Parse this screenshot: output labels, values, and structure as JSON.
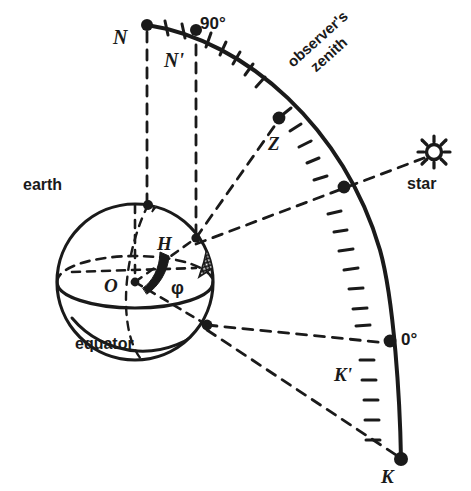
{
  "figure": {
    "ink_color": "#1a1a1a",
    "background": "#ffffff"
  },
  "labels": {
    "north_pole_celestial": "N",
    "north_pole_earth": "N'",
    "degrees_90": "90°",
    "degrees_0": "0°",
    "zenith_point": "Z",
    "observers_zenith": "observer's\nzenith",
    "observers_zenith_line1": "observer's",
    "observers_zenith_line2": "zenith",
    "star": "star",
    "earth": "earth",
    "equator": "equator",
    "center": "O",
    "hour_point": "H",
    "latitude_angle": "φ",
    "south_celestial": "K",
    "south_earth": "K'"
  },
  "geometry": {
    "sphere": {
      "cx": 135,
      "cy": 282,
      "r": 78
    },
    "arc": {
      "from": "N",
      "to": "K",
      "tick_count": 22,
      "nodes": [
        {
          "name": "N",
          "x": 147,
          "y": 25
        },
        {
          "name": "N'",
          "x": 196,
          "y": 38
        },
        {
          "name": "Z",
          "x": 280,
          "y": 118
        },
        {
          "name": "star-crossing",
          "x": 344,
          "y": 187
        },
        {
          "name": "0deg",
          "x": 392,
          "y": 341
        },
        {
          "name": "K",
          "x": 401,
          "y": 459
        }
      ]
    },
    "points": {
      "O": {
        "x": 135,
        "y": 282
      },
      "earth_north_pole": {
        "x": 148,
        "y": 205
      },
      "observer": {
        "x": 196,
        "y": 238
      },
      "equator_node": {
        "x": 207,
        "y": 325
      },
      "H": {
        "x": 175,
        "y": 252
      },
      "star": {
        "x": 434,
        "y": 152
      }
    }
  },
  "elements": [
    {
      "name": "earth-sphere-outline",
      "kind": "circle"
    },
    {
      "name": "equator-ellipse",
      "kind": "ellipse"
    },
    {
      "name": "meridian-ellipse",
      "kind": "ellipse"
    },
    {
      "name": "observer-hatch-band",
      "kind": "filled-band"
    },
    {
      "name": "celestial-arc",
      "kind": "ticked-arc"
    },
    {
      "name": "sight-line-to-star",
      "kind": "dashed-line"
    },
    {
      "name": "zenith-sight-line",
      "kind": "dashed-line"
    },
    {
      "name": "polar-axis",
      "kind": "dashed-line"
    },
    {
      "name": "latitude-angle-wedge",
      "kind": "filled-wedge"
    }
  ]
}
